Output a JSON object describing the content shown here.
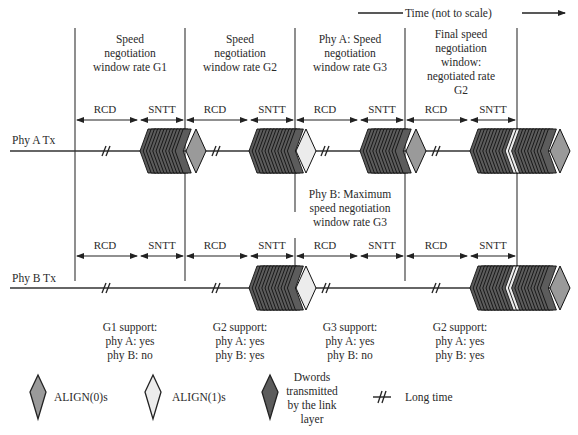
{
  "title": "Time (not to scale)",
  "colors": {
    "align0": "#9a9a9a",
    "align1": "#ececec",
    "dword": "#5c5c5c",
    "line": "#333333",
    "background": "#ffffff"
  },
  "windows": [
    {
      "label_lines": [
        "Speed",
        "negotiation",
        "window rate G1"
      ],
      "rcd": "RCD",
      "sntt": "SNTT"
    },
    {
      "label_lines": [
        "Speed",
        "negotiation",
        "window rate G2"
      ],
      "rcd": "RCD",
      "sntt": "SNTT"
    },
    {
      "label_lines": [
        "Phy A: Speed",
        "negotiation",
        "window rate G3"
      ],
      "rcd": "RCD",
      "sntt": "SNTT"
    },
    {
      "label_lines": [
        "Final speed",
        "negotiation",
        "window:",
        "negotiated rate",
        "G2"
      ],
      "rcd": "RCD",
      "sntt": "SNTT"
    }
  ],
  "phy_b_note": [
    "Phy B: Maximum",
    "speed negotiation",
    "window rate G3"
  ],
  "rows": [
    {
      "label": "Phy A Tx"
    },
    {
      "label": "Phy B Tx"
    }
  ],
  "support": [
    {
      "lines": [
        "G1 support:",
        "phy A: yes",
        "phy B: no"
      ]
    },
    {
      "lines": [
        "G2 support:",
        "phy A: yes",
        "phy B: yes"
      ]
    },
    {
      "lines": [
        "G3 support:",
        "phy A: yes",
        "phy B: no"
      ]
    },
    {
      "lines": [
        "G2 support:",
        "phy A: yes",
        "phy B: yes"
      ]
    }
  ],
  "legend": [
    {
      "icon": "align0-diamond-icon",
      "label": "ALIGN(0)s"
    },
    {
      "icon": "align1-diamond-icon",
      "label": "ALIGN(1)s"
    },
    {
      "icon": "dword-diamond-icon",
      "label_lines": [
        "Dwords",
        "transmitted",
        "by the link",
        "layer"
      ]
    },
    {
      "icon": "long-time-break-icon",
      "label": "Long time"
    }
  ]
}
